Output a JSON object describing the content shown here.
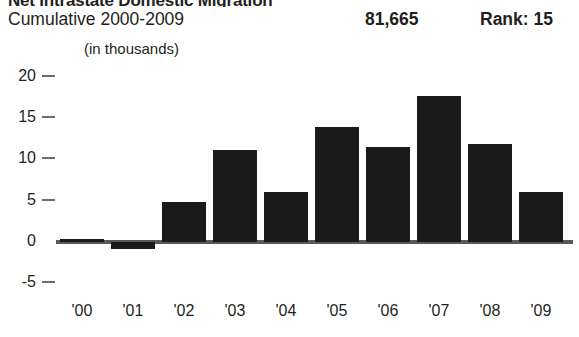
{
  "panel": {
    "title": "Net Intrastate Domestic Migration",
    "subtitle": "Cumulative 2000-2009",
    "total_label": "81,665",
    "rank_label": "Rank: 15",
    "units_note": "(in thousands)"
  },
  "chart_data": {
    "type": "bar",
    "title": "Net Intrastate Domestic Migration",
    "subtitle": "Cumulative 2000-2009",
    "xlabel": "",
    "ylabel": "(in thousands)",
    "categories": [
      "'00",
      "'01",
      "'02",
      "'03",
      "'04",
      "'05",
      "'06",
      "'07",
      "'08",
      "'09"
    ],
    "values": [
      0.4,
      -0.8,
      4.8,
      11.1,
      6.0,
      13.8,
      11.4,
      17.6,
      11.8,
      6.0
    ],
    "ylim": [
      -5,
      20
    ],
    "yticks": [
      20,
      15,
      10,
      5,
      0,
      -5
    ],
    "ytick_labels": [
      "20",
      "15",
      "10",
      "5",
      "0",
      "-5"
    ],
    "grid": false,
    "legend": "none",
    "bar_color": "#1a1a1a",
    "axis_color": "#58595b",
    "cumulative_total": "81,665",
    "rank": "Rank: 15"
  }
}
